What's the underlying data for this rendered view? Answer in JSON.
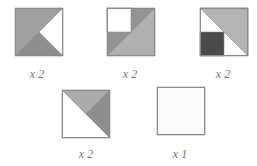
{
  "colors": {
    "outline": "#8a8a8a",
    "mid_gray": "#a0a0a0",
    "darker_gray": "#8e8e8e",
    "light_gray": "#b4b4b4",
    "dark": "#4a4a4a",
    "white": "#ffffff",
    "near_white": "#fbfbfb",
    "label": "#777777"
  },
  "tiles": [
    {
      "id": "tile-1",
      "x": 15,
      "y": 8,
      "size": 48,
      "label": "x 2",
      "label_x": 17,
      "label_y": 68,
      "shapes": [
        {
          "type": "polygon",
          "points": "0,0 48,0 0,48",
          "fill": "#a0a0a0"
        },
        {
          "type": "polygon",
          "points": "0,48 24,24 48,48",
          "fill": "#8e8e8e"
        },
        {
          "type": "polygon",
          "points": "48,0 24,24 48,48",
          "fill": "#ffffff"
        }
      ]
    },
    {
      "id": "tile-2",
      "x": 107,
      "y": 8,
      "size": 48,
      "label": "x 2",
      "label_x": 110,
      "label_y": 68,
      "shapes": [
        {
          "type": "polygon",
          "points": "0,0 48,0 0,48",
          "fill": "#939393"
        },
        {
          "type": "polygon",
          "points": "48,0 48,48 0,48",
          "fill": "#b0b0b0"
        },
        {
          "type": "rect",
          "x": 0,
          "y": 0,
          "w": 24,
          "h": 24,
          "fill": "#ffffff"
        }
      ]
    },
    {
      "id": "tile-3",
      "x": 200,
      "y": 8,
      "size": 48,
      "label": "x 2",
      "label_x": 203,
      "label_y": 68,
      "shapes": [
        {
          "type": "rect",
          "x": 0,
          "y": 0,
          "w": 48,
          "h": 48,
          "fill": "#ffffff"
        },
        {
          "type": "polygon",
          "points": "0,0 48,0 48,48",
          "fill": "#b4b4b4"
        },
        {
          "type": "rect",
          "x": 0,
          "y": 24,
          "w": 24,
          "h": 24,
          "fill": "#4a4a4a"
        }
      ]
    },
    {
      "id": "tile-4",
      "x": 62,
      "y": 90,
      "size": 48,
      "label": "x 2",
      "label_x": 66,
      "label_y": 148,
      "shapes": [
        {
          "type": "polygon",
          "points": "0,0 48,48 0,48",
          "fill": "#ffffff"
        },
        {
          "type": "polygon",
          "points": "0,0 48,0 24,24",
          "fill": "#acacac"
        },
        {
          "type": "polygon",
          "points": "48,0 48,48 24,24",
          "fill": "#8e8e8e"
        }
      ]
    },
    {
      "id": "tile-5",
      "x": 157,
      "y": 87,
      "size": 48,
      "label": "x 1",
      "label_x": 160,
      "label_y": 148,
      "shapes": [
        {
          "type": "rect",
          "x": 0,
          "y": 0,
          "w": 48,
          "h": 48,
          "fill": "#fbfbfb"
        }
      ]
    }
  ]
}
